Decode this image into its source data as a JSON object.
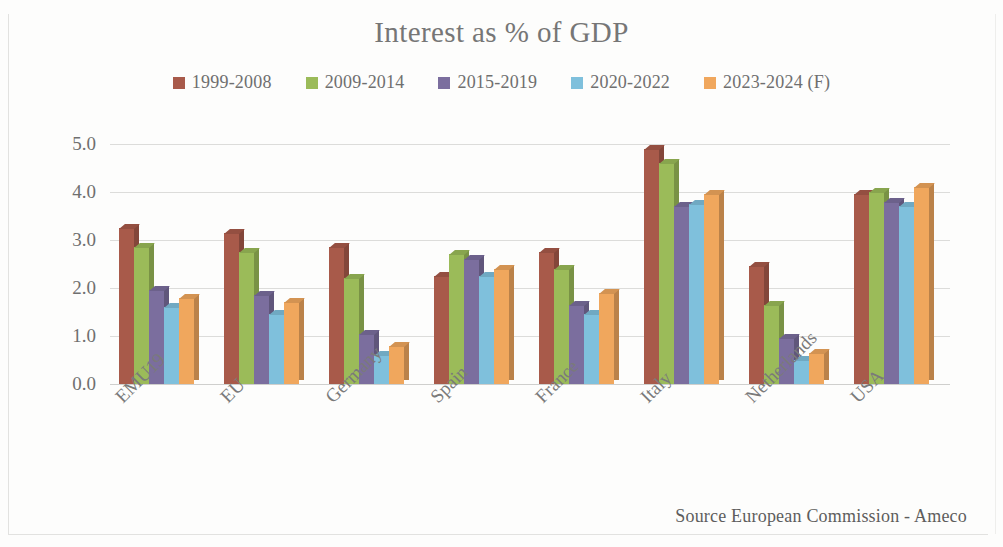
{
  "chart_data": {
    "type": "bar",
    "title": "Interest as % of GDP",
    "xlabel": "",
    "ylabel": "",
    "ylim": [
      0.0,
      5.0
    ],
    "ytick_labels": [
      "0.0",
      "1.0",
      "2.0",
      "3.0",
      "4.0",
      "5.0"
    ],
    "yticks": [
      0.0,
      1.0,
      2.0,
      3.0,
      4.0,
      5.0
    ],
    "grid": true,
    "legend_position": "top-center",
    "categories": [
      "EMU19",
      "EU",
      "Germany",
      "Spain",
      "France",
      "Italy",
      "Netherlands",
      "USA"
    ],
    "series": [
      {
        "name": "1999-2008",
        "color": "#a85a4a",
        "values": [
          3.25,
          3.15,
          2.85,
          2.25,
          2.75,
          4.9,
          2.45,
          3.95
        ]
      },
      {
        "name": "2009-2014",
        "color": "#9bbb59",
        "values": [
          2.85,
          2.75,
          2.2,
          2.7,
          2.4,
          4.6,
          1.65,
          4.0
        ]
      },
      {
        "name": "2015-2019",
        "color": "#7b6e9e",
        "values": [
          1.95,
          1.85,
          1.05,
          2.6,
          1.65,
          3.7,
          0.95,
          3.8
        ]
      },
      {
        "name": "2020-2022",
        "color": "#7fc0dc",
        "values": [
          1.6,
          1.45,
          0.6,
          2.25,
          1.45,
          3.75,
          0.5,
          3.7
        ]
      },
      {
        "name": "2023-2024 (F)",
        "color": "#f0a75d",
        "values": [
          1.8,
          1.7,
          0.8,
          2.4,
          1.9,
          3.95,
          0.65,
          4.1
        ]
      }
    ],
    "source_note": "Source European Commission - Ameco"
  }
}
